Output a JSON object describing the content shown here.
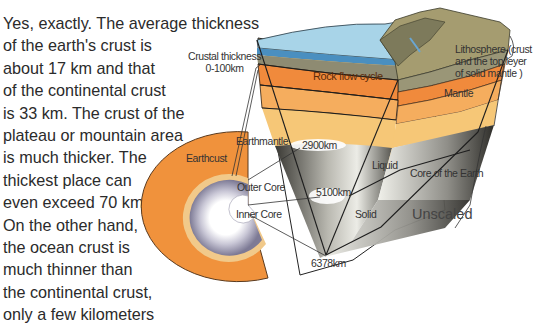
{
  "paragraph": {
    "lines": [
      "Yes, exactly. The average thickness",
      "of the earth's crust is",
      "about 17 km and that",
      "of the continental crust",
      "is 33 km. The crust of the",
      "plateau or mountain area",
      "is much thicker. The",
      "thickest place can",
      "even exceed 70 km.",
      "On the other hand,",
      "the ocean crust is",
      "much thinner than",
      "the continental crust,",
      "only a few kilometers"
    ]
  },
  "diagram": {
    "labels": {
      "crustal_thickness_1": "Crustal thickness",
      "crustal_thickness_2": "0-100km",
      "lithosphere_1": "Lithosphere (crust",
      "lithosphere_2": "and the top leyer",
      "lithosphere_3": "of solid mantle )",
      "mantle": "Mantle",
      "rock_flow_cycle": "Rock flow cycle",
      "earthcust": "Earthcust",
      "earthmantle": "Earthmantle",
      "outer_core": "Outer Core",
      "inner_core": "Inner Core",
      "depth_2900": "2900km",
      "depth_5100": "5100km",
      "depth_6378": "6378km",
      "liquid": "Liquid",
      "solid": "Solid",
      "core_of_earth": "Core of the Earth",
      "unscaled": "Unscaled"
    },
    "colors": {
      "ocean": "#9fcfe6",
      "mountain": "#8b8a6a",
      "land": "#b9ad7c",
      "rock_flow": "#f08a3c",
      "mantle_mid": "#f5ad5e",
      "mantle_low": "#f6c777",
      "core_dark": "#3e3d38",
      "core_light": "#e9e9e4",
      "crust_orange": "#f0923c",
      "inner_purple": "#8a87a2"
    }
  }
}
